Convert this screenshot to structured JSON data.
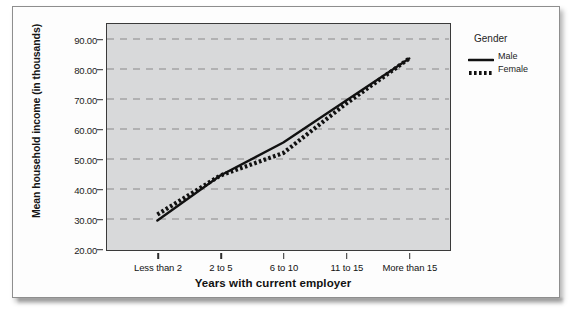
{
  "chart_data": {
    "type": "line",
    "title": "",
    "xlabel": "Years with current employer",
    "ylabel": "Mean household income (in thousands)",
    "categories": [
      "Less than 2",
      "2 to 5",
      "6 to 10",
      "11 to 15",
      "More than 15"
    ],
    "series": [
      {
        "name": "Male",
        "style": "solid",
        "values": [
          29.5,
          44.5,
          55.5,
          69.5,
          83.5
        ]
      },
      {
        "name": "Female",
        "style": "dotted",
        "values": [
          31.5,
          44.5,
          52.0,
          68.5,
          83.5
        ]
      }
    ],
    "ylim": [
      20,
      95
    ],
    "yticks": [
      20,
      30,
      40,
      50,
      60,
      70,
      80,
      90
    ],
    "ytick_labels": [
      "20.00",
      "30.00",
      "40.00",
      "50.00",
      "60.00",
      "70.00",
      "80.00",
      "90.00"
    ],
    "grid": true,
    "grid_style": "dashed",
    "legend": {
      "title": "Gender",
      "position": "right",
      "entries": [
        {
          "label": "Male",
          "style": "solid"
        },
        {
          "label": "Female",
          "style": "dotted"
        }
      ]
    },
    "colors": {
      "plot_background": "#d8d9da",
      "page_background": "#fdfdfd",
      "line": "#111111",
      "gridline": "#8a8a8a",
      "axis": "#2d2d2d",
      "text": "#151515"
    }
  }
}
